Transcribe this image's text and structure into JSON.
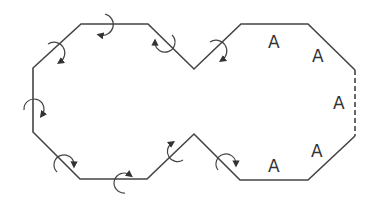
{
  "diagram": {
    "stroke_color": "#444444",
    "labels": [
      {
        "text": "A",
        "x": 268,
        "y": 48
      },
      {
        "text": "A",
        "x": 312,
        "y": 62
      },
      {
        "text": "A",
        "x": 335,
        "y": 109
      },
      {
        "text": "A",
        "x": 312,
        "y": 156
      },
      {
        "text": "A",
        "x": 268,
        "y": 172
      }
    ],
    "rotation_arrow_count": 9,
    "dashed_edge": "right vertical edge of right octagon"
  }
}
